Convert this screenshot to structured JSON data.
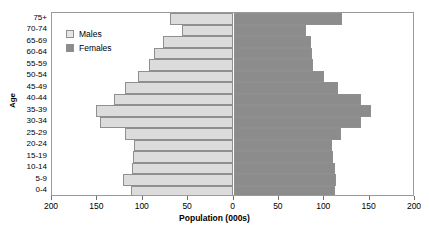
{
  "chart_data": {
    "type": "bar",
    "subtype": "population-pyramid",
    "title": "",
    "xlabel": "Population (000s)",
    "ylabel": "Age",
    "categories": [
      "0-4",
      "5-9",
      "10-14",
      "15-19",
      "20-24",
      "25-29",
      "30-34",
      "35-39",
      "40-44",
      "45-49",
      "50-54",
      "55-59",
      "60-64",
      "65-69",
      "70-74",
      "75+"
    ],
    "category_order_top_to_bottom": [
      "75+",
      "70-74",
      "65-69",
      "60-64",
      "55-59",
      "50-54",
      "45-49",
      "40-44",
      "35-39",
      "30-34",
      "25-29",
      "20-24",
      "15-19",
      "10-14",
      "5-9",
      "0-4"
    ],
    "series": [
      {
        "name": "Males",
        "color": "#dcdcdc",
        "side": "left",
        "values": [
          113,
          122,
          112,
          111,
          110,
          120,
          147,
          152,
          132,
          120,
          105,
          93,
          88,
          78,
          57,
          70
        ]
      },
      {
        "name": "Females",
        "color": "#8c8c8c",
        "side": "right",
        "values": [
          112,
          113,
          112,
          110,
          108,
          118,
          140,
          152,
          140,
          115,
          100,
          88,
          87,
          85,
          80,
          120
        ]
      }
    ],
    "xlim": [
      -200,
      200
    ],
    "xticks": [
      -200,
      -150,
      -100,
      -50,
      0,
      50,
      100,
      150,
      200
    ],
    "xtick_labels": [
      "200",
      "150",
      "100",
      "50",
      "0",
      "50",
      "100",
      "150",
      "200"
    ],
    "grid": false,
    "legend_position": "upper-left-inside"
  },
  "legend": {
    "entries": [
      {
        "label": "Males",
        "swatch": "male"
      },
      {
        "label": "Females",
        "swatch": "female"
      }
    ]
  },
  "axes": {
    "y_title": "Age",
    "x_title": "Population (000s)"
  },
  "colors": {
    "male_fill": "#dcdcdc",
    "female_fill": "#8c8c8c",
    "bar_border": "#8f8f8f",
    "frame": "#9a9a9a",
    "text": "#000000"
  }
}
